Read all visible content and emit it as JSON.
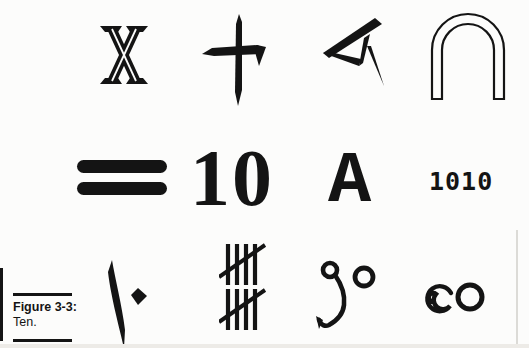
{
  "page": {
    "bg": "#fcfcfb",
    "ink": "#141414"
  },
  "figure": {
    "label": "Figure 3-3:",
    "caption": "Ten."
  },
  "numerals": {
    "decimal": "10",
    "hexadecimal": "A",
    "binary": "1010"
  },
  "symbols": {
    "row1": [
      "roman-numeral-ten-icon",
      "chinese-ten-icon",
      "babylonian-cuneiform-ten-icon",
      "egyptian-arch-ten-icon"
    ],
    "row2": [
      "mayan-bars-ten-icon",
      "decimal-ten",
      "hexadecimal-ten",
      "binary-ten"
    ],
    "row3": [
      "arabic-indic-ten-icon",
      "tally-marks-ten-icon",
      "bengali-ten-icon",
      "burmese-ten-icon"
    ]
  }
}
